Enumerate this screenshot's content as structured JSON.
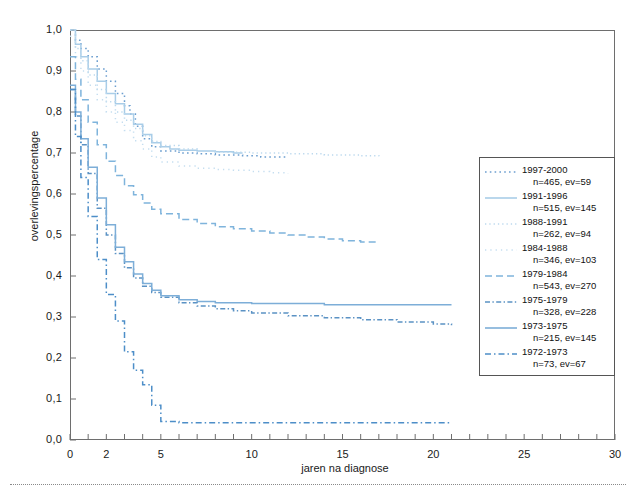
{
  "axes": {
    "ylabel": "overlevingspercentage",
    "xlabel": "jaren na diagnose",
    "yticks": [
      "0,0",
      "0,1",
      "0,2",
      "0,3",
      "0,4",
      "0,5",
      "0,6",
      "0,7",
      "0,8",
      "0,9",
      "1,0"
    ],
    "xticks": [
      "0",
      "2",
      "5",
      "10",
      "15",
      "20",
      "25",
      "30"
    ]
  },
  "legend": {
    "items": [
      {
        "label": "1997-2000",
        "stats": "n=465, ev=59",
        "style": "dotted",
        "color": "#6d9fd0"
      },
      {
        "label": "1991-1996",
        "stats": "n=515, ev=145",
        "style": "solid",
        "color": "#a9cde8"
      },
      {
        "label": "1988-1991",
        "stats": "n=262, ev=94",
        "style": "dotted-fine",
        "color": "#bcd9ee"
      },
      {
        "label": "1984-1988",
        "stats": "n=346, ev=103",
        "style": "dotted-sparse",
        "color": "#c5def0"
      },
      {
        "label": "1979-1984",
        "stats": "n=543, ev=270",
        "style": "dashed",
        "color": "#7fb4dc"
      },
      {
        "label": "1975-1979",
        "stats": "n=328, ev=228",
        "style": "dash-dot",
        "color": "#5b92c4"
      },
      {
        "label": "1973-1975",
        "stats": "n=215, ev=145",
        "style": "solid",
        "color": "#7daed8"
      },
      {
        "label": "1972-1973",
        "stats": "n=73, ev=67",
        "style": "dash-dot-long",
        "color": "#4d8ec8"
      }
    ]
  },
  "chart_data": {
    "type": "line",
    "title": "",
    "xlabel": "jaren na diagnose",
    "ylabel": "overlevingspercentage",
    "xlim": [
      0,
      30
    ],
    "ylim": [
      0,
      1
    ],
    "grid": false,
    "legend_position": "right",
    "series": [
      {
        "name": "1997-2000",
        "n": 465,
        "ev": 59,
        "color": "#6d9fd0",
        "style": "dotted",
        "x": [
          0,
          0.3,
          0.6,
          1.0,
          1.5,
          2.0,
          2.5,
          3.0,
          3.3,
          3.6,
          4.0,
          4.5,
          5.0,
          6.0,
          7.0,
          8.0,
          9.5,
          10.5,
          12.0
        ],
        "y": [
          1.0,
          0.975,
          0.955,
          0.935,
          0.905,
          0.875,
          0.845,
          0.815,
          0.795,
          0.765,
          0.735,
          0.715,
          0.705,
          0.7,
          0.698,
          0.695,
          0.693,
          0.69,
          0.69
        ]
      },
      {
        "name": "1991-1996",
        "n": 515,
        "ev": 145,
        "color": "#a9cde8",
        "style": "solid",
        "x": [
          0,
          0.3,
          0.6,
          1.0,
          1.5,
          2.0,
          2.5,
          3.0,
          3.5,
          4.0,
          4.5,
          5.0,
          5.5,
          6.0,
          7.0,
          8.0,
          9.0,
          9.5
        ],
        "y": [
          1.0,
          0.965,
          0.935,
          0.905,
          0.875,
          0.845,
          0.82,
          0.795,
          0.77,
          0.745,
          0.725,
          0.715,
          0.71,
          0.707,
          0.705,
          0.703,
          0.7,
          0.7
        ]
      },
      {
        "name": "1988-1991",
        "n": 262,
        "ev": 94,
        "color": "#bcd9ee",
        "style": "dotted-fine",
        "x": [
          0,
          0.3,
          0.6,
          1.0,
          1.5,
          2.0,
          2.5,
          3.0,
          3.5,
          4.0,
          4.5,
          5.0,
          6.0,
          7.0,
          8.0,
          10.0,
          12.0,
          14.0,
          16.0,
          17.0
        ],
        "y": [
          1.0,
          0.955,
          0.925,
          0.89,
          0.855,
          0.825,
          0.8,
          0.78,
          0.76,
          0.742,
          0.728,
          0.718,
          0.71,
          0.705,
          0.702,
          0.7,
          0.698,
          0.695,
          0.693,
          0.692
        ]
      },
      {
        "name": "1984-1988",
        "n": 346,
        "ev": 103,
        "color": "#c5def0",
        "style": "dotted-sparse",
        "x": [
          0,
          0.3,
          0.6,
          1.0,
          1.5,
          2.0,
          2.5,
          3.0,
          3.5,
          4.0,
          4.5,
          5.0,
          6.0,
          7.0,
          8.0,
          9.0,
          10.0,
          11.0,
          12.0
        ],
        "y": [
          0.985,
          0.935,
          0.9,
          0.865,
          0.83,
          0.8,
          0.775,
          0.755,
          0.73,
          0.71,
          0.69,
          0.678,
          0.668,
          0.663,
          0.66,
          0.658,
          0.655,
          0.652,
          0.65
        ]
      },
      {
        "name": "1979-1984",
        "n": 543,
        "ev": 270,
        "color": "#7fb4dc",
        "style": "dashed",
        "x": [
          0,
          0.3,
          0.6,
          1.0,
          1.5,
          2.0,
          2.5,
          3.0,
          3.5,
          4.0,
          4.5,
          5.0,
          6.0,
          7.0,
          8.0,
          9.0,
          10.0,
          11.0,
          12.0,
          13.0,
          14.0,
          15.0,
          16.0,
          17.0
        ],
        "y": [
          0.935,
          0.88,
          0.83,
          0.775,
          0.72,
          0.68,
          0.645,
          0.62,
          0.598,
          0.578,
          0.563,
          0.552,
          0.538,
          0.528,
          0.52,
          0.515,
          0.51,
          0.505,
          0.5,
          0.495,
          0.49,
          0.486,
          0.483,
          0.481
        ]
      },
      {
        "name": "1975-1979",
        "n": 328,
        "ev": 228,
        "color": "#5b92c4",
        "style": "dash-dot",
        "x": [
          0,
          0.3,
          0.6,
          1.0,
          1.5,
          2.0,
          2.5,
          3.0,
          3.5,
          4.0,
          4.5,
          5.0,
          6.0,
          7.0,
          8.0,
          9.0,
          10.0,
          12.0,
          14.0,
          16.0,
          18.0,
          20.0,
          21.0
        ],
        "y": [
          0.855,
          0.79,
          0.72,
          0.65,
          0.565,
          0.5,
          0.455,
          0.42,
          0.395,
          0.375,
          0.36,
          0.348,
          0.335,
          0.327,
          0.32,
          0.315,
          0.31,
          0.303,
          0.298,
          0.293,
          0.288,
          0.283,
          0.28
        ]
      },
      {
        "name": "1973-1975",
        "n": 215,
        "ev": 145,
        "color": "#7daed8",
        "style": "solid",
        "x": [
          0,
          0.3,
          0.6,
          1.0,
          1.5,
          2.0,
          2.5,
          3.0,
          3.5,
          4.0,
          4.5,
          5.0,
          6.0,
          7.0,
          8.0,
          10.0,
          12.0,
          14.0,
          16.0,
          18.0,
          20.0,
          21.0
        ],
        "y": [
          0.865,
          0.8,
          0.735,
          0.665,
          0.59,
          0.525,
          0.47,
          0.435,
          0.405,
          0.382,
          0.365,
          0.352,
          0.342,
          0.338,
          0.335,
          0.333,
          0.333,
          0.33,
          0.33,
          0.33,
          0.33,
          0.33
        ]
      },
      {
        "name": "1972-1973",
        "n": 73,
        "ev": 67,
        "color": "#4d8ec8",
        "style": "dash-dot-long",
        "x": [
          0,
          0.3,
          0.6,
          1.0,
          1.5,
          2.0,
          2.5,
          3.0,
          3.5,
          4.0,
          4.5,
          5.0,
          6.0,
          8.0,
          10.0,
          13.0,
          16.0,
          19.0,
          21.0
        ],
        "y": [
          0.855,
          0.74,
          0.64,
          0.545,
          0.44,
          0.355,
          0.29,
          0.215,
          0.17,
          0.135,
          0.085,
          0.045,
          0.042,
          0.042,
          0.042,
          0.042,
          0.042,
          0.042,
          0.042
        ]
      }
    ]
  }
}
